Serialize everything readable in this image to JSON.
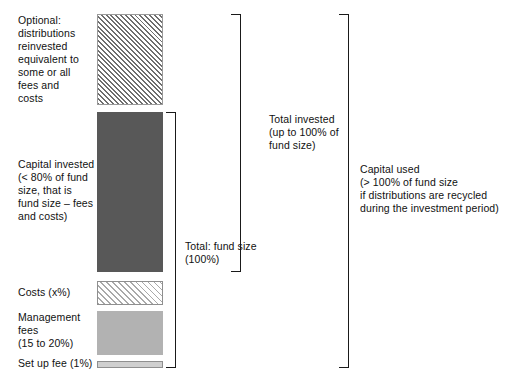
{
  "diagram": {
    "labels": {
      "optional_distributions": "Optional:\ndistributions\nreinvested\nequivalent to\nsome or all\nfees and\ncosts",
      "capital_invested": "Capital invested\n(< 80% of fund\nsize, that is\nfund size – fees\nand costs)",
      "costs": "Costs (x%)",
      "management_fees": "Management\nfees\n(15 to 20%)",
      "set_up_fee": "Set up fee (1%)",
      "total_fund_size": "Total: fund size\n(100%)",
      "total_invested": "Total invested\n(up to 100% of\nfund size)",
      "capital_used": "Capital used\n(> 100% of fund size\nif distributions are recycled\nduring the investment period)"
    },
    "bars": [
      {
        "name": "optional-distributions-bar",
        "style": "hatch-dense",
        "fill": "#6e6e6e",
        "border": "#9a9a9a"
      },
      {
        "name": "capital-invested-bar",
        "style": "solid-dark",
        "fill": "#585858",
        "border": "none"
      },
      {
        "name": "costs-bar",
        "style": "hatch-light",
        "fill": "#a9a9a9",
        "border": "#8f8f8f"
      },
      {
        "name": "management-fees-bar",
        "style": "solid-mid",
        "fill": "#b2b2b2",
        "border": "none"
      },
      {
        "name": "set-up-fee-bar",
        "style": "thin-light",
        "fill": "#cfcfcf",
        "border": "#8f8f8f"
      }
    ],
    "brackets": [
      {
        "name": "total-fund-size-bracket",
        "label_key": "total_fund_size"
      },
      {
        "name": "total-invested-bracket",
        "label_key": "total_invested"
      },
      {
        "name": "capital-used-bracket",
        "label_key": "capital_used"
      }
    ],
    "colors": {
      "text": "#111111",
      "bracket_line": "#1a1a1a",
      "background": "#ffffff"
    }
  }
}
